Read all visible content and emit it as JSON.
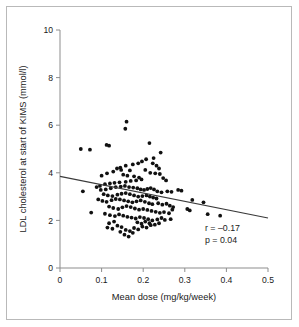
{
  "chart_data": {
    "type": "scatter",
    "title": "",
    "xlabel": "Mean dose (mg/kg/week)",
    "ylabel": "LDL cholesterol at start of KIMS (mmol/l)",
    "xlim": [
      0,
      0.5
    ],
    "ylim": [
      0,
      10
    ],
    "xticks": [
      0,
      0.1,
      0.2,
      0.3,
      0.4,
      0.5
    ],
    "xtick_labels": [
      "0",
      "0.1",
      "0.2",
      "0.3",
      "0.4",
      "0.5"
    ],
    "yticks": [
      0,
      2,
      4,
      6,
      8,
      10
    ],
    "ytick_labels": [
      "0",
      "2",
      "4",
      "6",
      "8",
      "10"
    ],
    "grid": false,
    "legend": "none",
    "marker_color": "#111111",
    "axis_color": "#8d8d8d",
    "fit_line": {
      "color": "#3a3a3a",
      "x0": 0.0,
      "y0": 3.85,
      "x1": 0.5,
      "y1": 2.1,
      "slope": -3.5,
      "intercept": 3.85
    },
    "annotations": {
      "r_label": "r = –0.17",
      "p_label": "p = 0.04",
      "r_value": -0.17,
      "p_value": 0.04
    },
    "points": [
      [
        0.05,
        5.0
      ],
      [
        0.072,
        4.97
      ],
      [
        0.055,
        3.22
      ],
      [
        0.075,
        2.33
      ],
      [
        0.112,
        5.17
      ],
      [
        0.118,
        5.14
      ],
      [
        0.16,
        6.15
      ],
      [
        0.157,
        5.85
      ],
      [
        0.215,
        5.25
      ],
      [
        0.242,
        4.85
      ],
      [
        0.225,
        4.62
      ],
      [
        0.207,
        4.57
      ],
      [
        0.197,
        4.48
      ],
      [
        0.188,
        4.4
      ],
      [
        0.175,
        4.35
      ],
      [
        0.158,
        4.3
      ],
      [
        0.145,
        4.22
      ],
      [
        0.137,
        4.18
      ],
      [
        0.223,
        4.4
      ],
      [
        0.232,
        4.3
      ],
      [
        0.238,
        4.18
      ],
      [
        0.128,
        4.05
      ],
      [
        0.113,
        3.98
      ],
      [
        0.1,
        3.88
      ],
      [
        0.147,
        4.12
      ],
      [
        0.168,
        4.1
      ],
      [
        0.205,
        4.12
      ],
      [
        0.217,
        4.0
      ],
      [
        0.229,
        3.98
      ],
      [
        0.24,
        3.95
      ],
      [
        0.248,
        3.78
      ],
      [
        0.255,
        3.68
      ],
      [
        0.152,
        3.92
      ],
      [
        0.162,
        3.88
      ],
      [
        0.178,
        3.85
      ],
      [
        0.19,
        3.8
      ],
      [
        0.196,
        3.72
      ],
      [
        0.183,
        3.68
      ],
      [
        0.17,
        3.66
      ],
      [
        0.158,
        3.62
      ],
      [
        0.143,
        3.6
      ],
      [
        0.131,
        3.58
      ],
      [
        0.12,
        3.55
      ],
      [
        0.108,
        3.52
      ],
      [
        0.096,
        3.45
      ],
      [
        0.088,
        3.4
      ],
      [
        0.098,
        3.28
      ],
      [
        0.11,
        3.3
      ],
      [
        0.122,
        3.35
      ],
      [
        0.134,
        3.4
      ],
      [
        0.146,
        3.42
      ],
      [
        0.156,
        3.45
      ],
      [
        0.166,
        3.4
      ],
      [
        0.176,
        3.38
      ],
      [
        0.186,
        3.35
      ],
      [
        0.194,
        3.3
      ],
      [
        0.202,
        3.28
      ],
      [
        0.21,
        3.32
      ],
      [
        0.218,
        3.36
      ],
      [
        0.226,
        3.3
      ],
      [
        0.234,
        3.22
      ],
      [
        0.244,
        3.18
      ],
      [
        0.258,
        3.22
      ],
      [
        0.268,
        3.2
      ],
      [
        0.284,
        3.28
      ],
      [
        0.292,
        3.25
      ],
      [
        0.105,
        3.1
      ],
      [
        0.115,
        3.05
      ],
      [
        0.126,
        3.02
      ],
      [
        0.138,
        3.08
      ],
      [
        0.148,
        3.12
      ],
      [
        0.158,
        3.15
      ],
      [
        0.168,
        3.1
      ],
      [
        0.178,
        3.05
      ],
      [
        0.188,
        3.0
      ],
      [
        0.198,
        3.02
      ],
      [
        0.208,
        3.05
      ],
      [
        0.216,
        3.0
      ],
      [
        0.224,
        2.96
      ],
      [
        0.232,
        2.92
      ],
      [
        0.092,
        2.88
      ],
      [
        0.102,
        2.82
      ],
      [
        0.112,
        2.78
      ],
      [
        0.124,
        2.85
      ],
      [
        0.134,
        2.9
      ],
      [
        0.144,
        2.88
      ],
      [
        0.154,
        2.84
      ],
      [
        0.164,
        2.8
      ],
      [
        0.174,
        2.76
      ],
      [
        0.184,
        2.8
      ],
      [
        0.194,
        2.84
      ],
      [
        0.204,
        2.78
      ],
      [
        0.214,
        2.72
      ],
      [
        0.222,
        2.68
      ],
      [
        0.236,
        2.72
      ],
      [
        0.246,
        2.66
      ],
      [
        0.256,
        2.7
      ],
      [
        0.264,
        2.62
      ],
      [
        0.272,
        2.56
      ],
      [
        0.118,
        2.58
      ],
      [
        0.128,
        2.52
      ],
      [
        0.14,
        2.48
      ],
      [
        0.15,
        2.55
      ],
      [
        0.16,
        2.6
      ],
      [
        0.17,
        2.56
      ],
      [
        0.18,
        2.5
      ],
      [
        0.19,
        2.45
      ],
      [
        0.2,
        2.48
      ],
      [
        0.21,
        2.44
      ],
      [
        0.22,
        2.4
      ],
      [
        0.23,
        2.36
      ],
      [
        0.24,
        2.32
      ],
      [
        0.25,
        2.35
      ],
      [
        0.262,
        2.3
      ],
      [
        0.27,
        2.45
      ],
      [
        0.306,
        2.48
      ],
      [
        0.312,
        2.42
      ],
      [
        0.318,
        2.86
      ],
      [
        0.345,
        2.76
      ],
      [
        0.355,
        2.26
      ],
      [
        0.385,
        2.2
      ],
      [
        0.108,
        2.28
      ],
      [
        0.12,
        2.22
      ],
      [
        0.132,
        2.18
      ],
      [
        0.142,
        2.25
      ],
      [
        0.152,
        2.2
      ],
      [
        0.162,
        2.15
      ],
      [
        0.172,
        2.12
      ],
      [
        0.182,
        2.08
      ],
      [
        0.192,
        2.14
      ],
      [
        0.202,
        2.1
      ],
      [
        0.212,
        2.05
      ],
      [
        0.222,
        2.0
      ],
      [
        0.234,
        2.04
      ],
      [
        0.244,
        2.1
      ],
      [
        0.252,
        2.02
      ],
      [
        0.266,
        2.05
      ],
      [
        0.114,
        1.7
      ],
      [
        0.126,
        1.65
      ],
      [
        0.138,
        1.78
      ],
      [
        0.148,
        1.72
      ],
      [
        0.158,
        1.6
      ],
      [
        0.168,
        1.55
      ],
      [
        0.178,
        1.68
      ],
      [
        0.188,
        1.62
      ],
      [
        0.198,
        1.74
      ],
      [
        0.208,
        1.7
      ],
      [
        0.218,
        1.8
      ],
      [
        0.155,
        1.4
      ],
      [
        0.165,
        1.32
      ],
      [
        0.175,
        1.48
      ],
      [
        0.145,
        1.52
      ],
      [
        0.196,
        1.86
      ],
      [
        0.186,
        1.92
      ],
      [
        0.13,
        1.95
      ],
      [
        0.118,
        1.88
      ],
      [
        0.205,
        1.95
      ],
      [
        0.215,
        1.88
      ],
      [
        0.228,
        1.82
      ],
      [
        0.238,
        1.88
      ]
    ]
  }
}
